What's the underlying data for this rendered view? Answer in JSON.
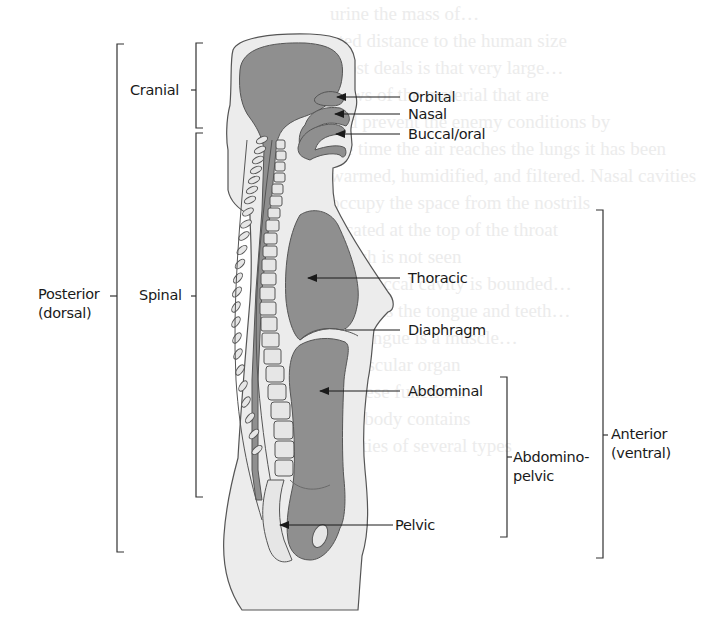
{
  "figure": {
    "type": "anatomical-diagram",
    "colors": {
      "body_fill": "#ececec",
      "cavity_fill": "#8f8f8f",
      "vertebra_fill": "#e6e6e6",
      "outline": "#555555",
      "label_text": "#1a1a1a"
    }
  },
  "labels": {
    "cranial": "Cranial",
    "orbital": "Orbital",
    "nasal": "Nasal",
    "buccal_oral": "Buccal/oral",
    "posterior_line1": "Posterior",
    "posterior_line2": "(dorsal)",
    "spinal": "Spinal",
    "thoracic": "Thoracic",
    "diaphragm": "Diaphragm",
    "abdominal": "Abdominal",
    "anterior_line1": "Anterior",
    "anterior_line2": "(ventral)",
    "abdominopelvic_line1": "Abdomino-",
    "abdominopelvic_line2": "pelvic",
    "pelvic": "Pelvic"
  },
  "background_text": [
    "urine the mass of…",
    "ated distance to the human size",
    "Most deals is that very large…",
    "flows of the material that are",
    "and prevent the enemy conditions by",
    "the time the air reaches the lungs it has been",
    "warmed, humidified, and filtered. Nasal cavities",
    "occupy the space from the nostrils",
    "located at the top of the throat",
    "which is not seen",
    "The buccal cavity is bounded…",
    "contains the tongue and teeth…",
    "the tongue is a muscle…",
    "a muscular organ",
    "of these functions",
    "The body contains",
    "cavities of several types"
  ]
}
